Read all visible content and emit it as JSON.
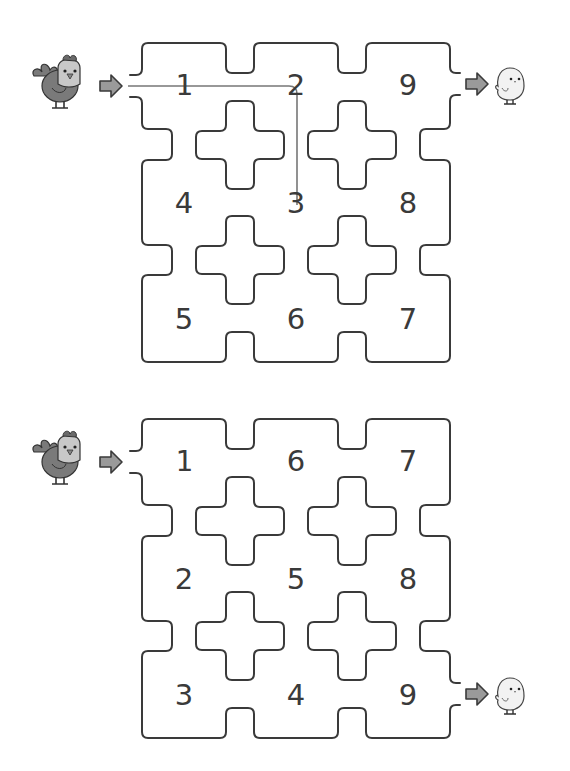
{
  "colors": {
    "wall": "#3a3a3a",
    "path_line": "#777777",
    "arrow_fill": "#9a9a9a",
    "arrow_stroke": "#3a3a3a",
    "hen_body": "#7a7a7a",
    "hen_face": "#c8c8c8",
    "hen_comb": "#6a6a6a",
    "chick_body": "#f2f2f2"
  },
  "puzzles": [
    {
      "id": "top",
      "offset_y": 0,
      "start_label": "hen",
      "goal_label": "chick",
      "exit_row": 0,
      "cells": [
        {
          "n": "1",
          "row": 0,
          "col": 0
        },
        {
          "n": "2",
          "row": 0,
          "col": 1
        },
        {
          "n": "9",
          "row": 0,
          "col": 2
        },
        {
          "n": "4",
          "row": 1,
          "col": 0
        },
        {
          "n": "3",
          "row": 1,
          "col": 1
        },
        {
          "n": "8",
          "row": 1,
          "col": 2
        },
        {
          "n": "5",
          "row": 2,
          "col": 0
        },
        {
          "n": "6",
          "row": 2,
          "col": 1
        },
        {
          "n": "7",
          "row": 2,
          "col": 2
        }
      ],
      "example_path": {
        "visible": true,
        "sequence": [
          "1",
          "2",
          "3"
        ]
      }
    },
    {
      "id": "bottom",
      "offset_y": 376,
      "start_label": "hen",
      "goal_label": "chick",
      "exit_row": 2,
      "cells": [
        {
          "n": "1",
          "row": 0,
          "col": 0
        },
        {
          "n": "6",
          "row": 0,
          "col": 1
        },
        {
          "n": "7",
          "row": 0,
          "col": 2
        },
        {
          "n": "2",
          "row": 1,
          "col": 0
        },
        {
          "n": "5",
          "row": 1,
          "col": 1
        },
        {
          "n": "8",
          "row": 1,
          "col": 2
        },
        {
          "n": "3",
          "row": 2,
          "col": 0
        },
        {
          "n": "4",
          "row": 2,
          "col": 1
        },
        {
          "n": "9",
          "row": 2,
          "col": 2
        }
      ],
      "example_path": {
        "visible": false,
        "sequence": []
      }
    }
  ],
  "icons": {
    "start": "hen-icon",
    "goal": "chick-icon",
    "arrow": "arrow-right-icon"
  }
}
